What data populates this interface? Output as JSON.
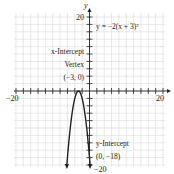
{
  "chart_data": {
    "type": "line",
    "title": "",
    "equation_label": "y = −2(x + 3)²",
    "function": "y = -2(x + 3)^2",
    "xlabel": "",
    "ylabel": "y",
    "xlim": [
      -20,
      20
    ],
    "ylim": [
      -20,
      20
    ],
    "grid": true,
    "tick_step": 2,
    "x_tick_labels": [
      "−20",
      "20"
    ],
    "y_tick_labels": [
      "20",
      "−20"
    ],
    "series": [
      {
        "name": "y = -2(x + 3)^2",
        "x": [
          -6.16,
          -6,
          -5,
          -4,
          -3,
          -2,
          -1,
          0,
          0.16
        ],
        "y": [
          -20,
          -18,
          -8,
          -2,
          0,
          -2,
          -8,
          -18,
          -20
        ]
      }
    ],
    "annotations": [
      {
        "text_lines": [
          "x-Intercept",
          "Vertex",
          "(−3, 0)"
        ],
        "point": [
          -3,
          0
        ]
      },
      {
        "text_lines": [
          "y-Intercept",
          "(0, −18)"
        ],
        "point": [
          0,
          -18
        ]
      }
    ]
  },
  "labels": {
    "y_axis": "y",
    "x_min": "−20",
    "x_max": "20",
    "y_max": "20",
    "y_min": "−20",
    "equation": "y = −2(x + 3)²",
    "vertex_line1": "x-Intercept",
    "vertex_line2": "Vertex",
    "vertex_line3": "(−3, 0)",
    "yint_line1": "y-Intercept",
    "yint_line2": "(0, −18)"
  },
  "colors": {
    "grid": "#d8d8d8",
    "axis": "#222222",
    "curve": "#222222"
  }
}
